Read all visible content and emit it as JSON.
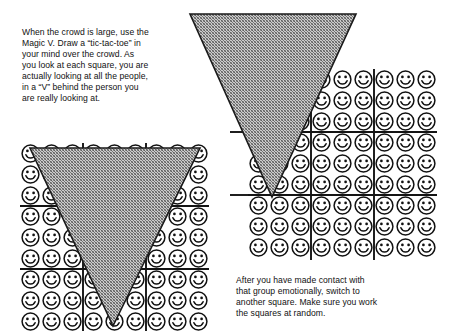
{
  "page": {
    "background_color": "#ffffff",
    "width": 452,
    "height": 331
  },
  "intro": {
    "text": "When the crowd is large, use the\nMagic V. Draw a “tic-tac-toe” in\nyour mind over the crowd. As\nyou look at each square, you are\nactually looking at all the people,\nin a “V” behind the person you\nare really looking at."
  },
  "outro": {
    "text": "After you have made contact with\nthat group emotionally, switch to\nanother square. Make sure you work\nthe squares at random."
  },
  "figures": {
    "left": {
      "name": "left-crowd-grid",
      "grid": {
        "columns": 9,
        "rows": 9,
        "cell": 21,
        "x": 20,
        "y": 143
      },
      "tic_tac_toe_lines": {
        "vertical": [
          83,
          146
        ],
        "horizontal": [
          206,
          269
        ]
      },
      "triangle": {
        "label": "magic-v-triangle",
        "points": "30,148 200,148 113,326",
        "fill_color": "#a8a8a8",
        "stroke_color": "#1a1a1a"
      }
    },
    "right": {
      "name": "right-crowd-grid",
      "grid": {
        "columns": 9,
        "rows": 9,
        "cell": 21,
        "x": 248,
        "y": 69
      },
      "tic_tac_toe_lines": {
        "vertical": [
          311,
          374
        ],
        "horizontal": [
          132,
          195
        ]
      },
      "triangle": {
        "label": "magic-v-triangle",
        "points": "190,14 356,14 272,197",
        "fill_color": "#a8a8a8",
        "stroke_color": "#1a1a1a"
      }
    }
  },
  "smiley": {
    "icon_name": "smiley-face-icon",
    "stroke_color": "#111111",
    "fill_color": "#ffffff",
    "count_per_grid": 81
  },
  "colors": {
    "ink": "#111111",
    "paper": "#ffffff",
    "halftone_gray": "#a8a8a8",
    "rule": "#141414"
  }
}
